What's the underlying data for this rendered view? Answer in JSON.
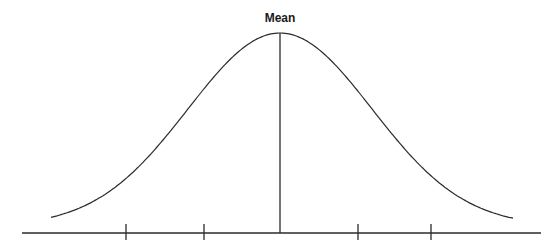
{
  "diagram": {
    "mean_label": "Mean",
    "colors": {
      "line": "#2b2b2b",
      "background": "#ffffff"
    },
    "axis": {
      "y": 233,
      "x_start": 22,
      "x_end": 541
    },
    "ticks_x": [
      126,
      204,
      358,
      431
    ],
    "mean_x": 280,
    "peak_y": 33,
    "curve_ends": {
      "left": [
        51,
        223
      ],
      "right": [
        514,
        224
      ]
    }
  }
}
